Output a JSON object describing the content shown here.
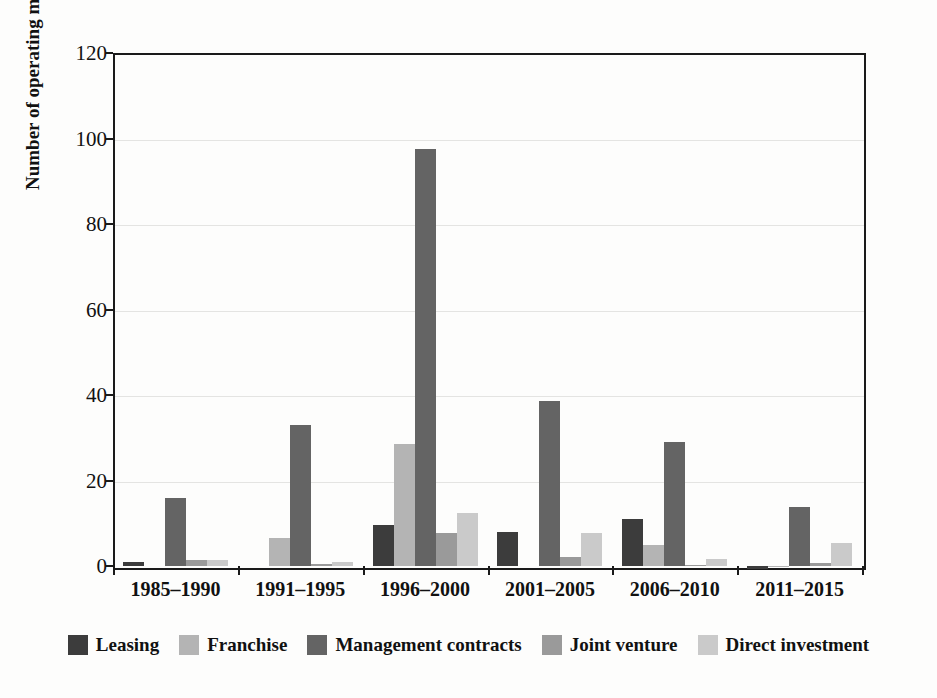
{
  "chart_data": {
    "type": "bar",
    "title": "",
    "subtitle": "",
    "xlabel": "",
    "ylabel": "Number of operating modes",
    "ylim": [
      0,
      120
    ],
    "yticks": [
      0,
      20,
      40,
      60,
      80,
      100,
      120
    ],
    "ytick_labels": [
      "0",
      "20",
      "40",
      "60",
      "80",
      "100",
      "120"
    ],
    "grid": true,
    "grid_axis": "y",
    "legend_position": "bottom",
    "orientation": "vertical",
    "grouping": "grouped",
    "categories": [
      "1985–1990",
      "1991–1995",
      "1996–2000",
      "2001–2005",
      "2006–2010",
      "2011–2015"
    ],
    "series": [
      {
        "name": "Leasing",
        "color": "#3c3c3c",
        "values": [
          1,
          0,
          9.5,
          8,
          11,
          -0.7
        ]
      },
      {
        "name": "Franchise",
        "color": "#b4b4b4",
        "values": [
          0,
          6.5,
          28.5,
          0,
          5,
          -0.3
        ]
      },
      {
        "name": "Management contracts",
        "color": "#646464",
        "values": [
          16,
          33,
          97.5,
          38.5,
          29,
          13.7
        ]
      },
      {
        "name": "Joint venture",
        "color": "#9a9a9a",
        "values": [
          1.5,
          0.5,
          7.8,
          2,
          0.3,
          0.6
        ]
      },
      {
        "name": "Direct investment",
        "color": "#cacaca",
        "values": [
          1.3,
          1,
          12.3,
          7.8,
          1.7,
          5.3
        ]
      }
    ],
    "annotations": []
  },
  "axes": {
    "y_axis_title": "Number of operating modes"
  },
  "colors": {
    "axis": "#1a1a1a",
    "grid": "#e4e4e2",
    "background": "#fdfdfc",
    "text": "#111111"
  }
}
